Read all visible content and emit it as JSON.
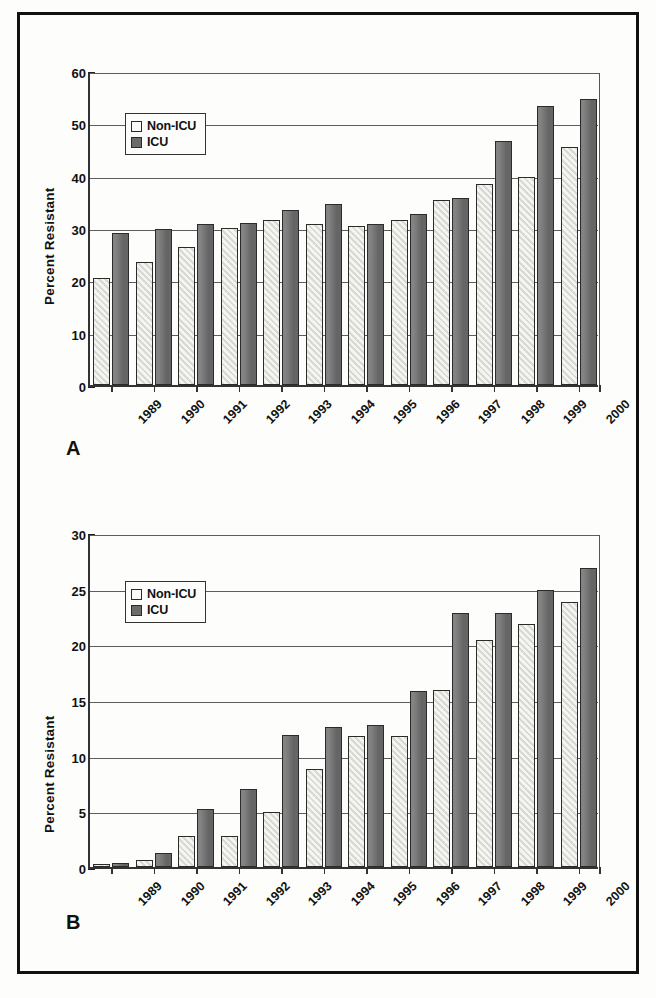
{
  "figure": {
    "panels": [
      {
        "letter": "A",
        "ylabel": "Percent Resistant",
        "yticks": [
          "0",
          "10",
          "20",
          "30",
          "40",
          "50",
          "60"
        ],
        "legend": [
          {
            "label": "Non-ICU",
            "swatch": "nonicu"
          },
          {
            "label": "ICU",
            "swatch": "icu"
          }
        ]
      },
      {
        "letter": "B",
        "ylabel": "Percent Resistant",
        "yticks": [
          "0",
          "5",
          "10",
          "15",
          "20",
          "25",
          "30"
        ],
        "legend": [
          {
            "label": "Non-ICU",
            "swatch": "nonicu"
          },
          {
            "label": "ICU",
            "swatch": "icu"
          }
        ]
      }
    ]
  },
  "chart_data": [
    {
      "type": "bar",
      "panel": "A",
      "title": "",
      "xlabel": "",
      "ylabel": "Percent Resistant",
      "ylim": [
        0,
        60
      ],
      "ytick_step": 10,
      "grid": true,
      "legend_position": "inside-top-left",
      "categories": [
        "1989",
        "1990",
        "1991",
        "1992",
        "1993",
        "1994",
        "1995",
        "1996",
        "1997",
        "1998",
        "1999",
        "2000"
      ],
      "series": [
        {
          "name": "Non-ICU",
          "values": [
            20.5,
            23.6,
            26.3,
            30.0,
            31.6,
            30.7,
            30.3,
            31.6,
            35.4,
            38.4,
            39.7,
            45.4
          ]
        },
        {
          "name": "ICU",
          "values": [
            29.0,
            29.9,
            30.8,
            31.0,
            33.4,
            34.6,
            30.7,
            32.6,
            35.8,
            46.7,
            53.4,
            54.6
          ]
        }
      ]
    },
    {
      "type": "bar",
      "panel": "B",
      "title": "",
      "xlabel": "",
      "ylabel": "Percent Resistant",
      "ylim": [
        0,
        30
      ],
      "ytick_step": 5,
      "grid": true,
      "legend_position": "inside-top-left",
      "categories": [
        "1989",
        "1990",
        "1991",
        "1992",
        "1993",
        "1994",
        "1995",
        "1996",
        "1997",
        "1998",
        "1999",
        "2000"
      ],
      "series": [
        {
          "name": "Non-ICU",
          "values": [
            0.3,
            0.6,
            2.8,
            2.8,
            4.9,
            8.8,
            11.8,
            11.8,
            15.9,
            20.4,
            21.8,
            23.8
          ]
        },
        {
          "name": "ICU",
          "values": [
            0.4,
            1.3,
            5.2,
            7.0,
            11.9,
            12.6,
            12.8,
            15.8,
            22.8,
            22.8,
            24.9,
            26.9
          ]
        }
      ]
    }
  ]
}
